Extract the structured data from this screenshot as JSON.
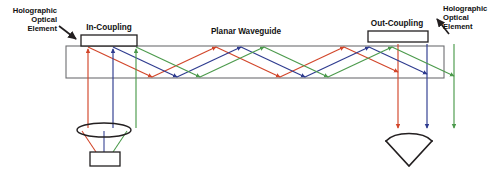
{
  "figure": {
    "background_color": "#ffffff"
  },
  "labels": {
    "hoe_left": {
      "line1": "Holographic",
      "line2": "Optical",
      "line3": "Element"
    },
    "in_coupling": "In-Coupling",
    "planar_waveguide": "Planar Waveguide",
    "out_coupling": "Out-Coupling",
    "hoe_right": {
      "line1": "Holographic",
      "line2": "Optical",
      "line3": "Element"
    }
  },
  "colors": {
    "red_ray": "#d2462a",
    "blue_ray": "#2e3b8f",
    "green_ray": "#4c9a4c",
    "outline": "#231f20",
    "waveguide_edge": "#6d6e71",
    "text": "#111111"
  },
  "components": {
    "waveguide": {
      "name": "Planar Waveguide",
      "top_y": 46,
      "bottom_y": 78,
      "left_x": 66,
      "right_x": 444
    },
    "in_coupling_grating": {
      "name": "In-Coupling holographic optical element",
      "x": 81,
      "y": 35,
      "width": 56,
      "height": 11,
      "fill": "none"
    },
    "out_coupling_grating": {
      "name": "Out-Coupling holographic optical element",
      "x": 368,
      "y": 31,
      "width": 60,
      "height": 11,
      "fill": "none"
    },
    "lens": {
      "name": "Collimating lens",
      "cx": 104,
      "cy": 130,
      "rx": 27,
      "ry": 7
    },
    "display_source": {
      "name": "Image source / microdisplay",
      "x": 90,
      "y": 152,
      "width": 30,
      "height": 14
    },
    "eye": {
      "name": "Viewer eye",
      "cx": 409,
      "cy": 150
    }
  },
  "rays": {
    "count": 3,
    "channels": [
      "red",
      "blue",
      "green"
    ],
    "input_x": [
      88,
      113,
      136
    ],
    "output_x": [
      398,
      427,
      454
    ],
    "description": "Three color channels enter the waveguide through the in-coupling HOE, propagate by total internal reflection, and exit through the out-coupling HOE toward the eye."
  }
}
